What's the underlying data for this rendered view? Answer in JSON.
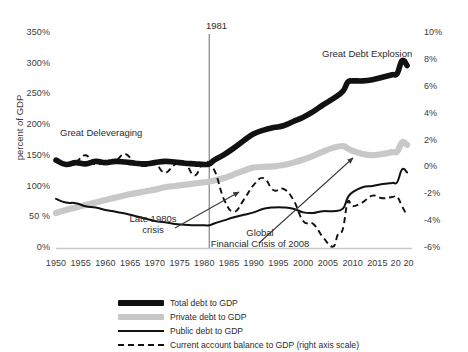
{
  "chart_data": {
    "type": "line",
    "title": "",
    "subtitle": "",
    "xlabel": "",
    "ylabel": "percent of GDP",
    "ylabel_right": "",
    "xlim": [
      1950,
      2022
    ],
    "ylim": [
      0,
      350
    ],
    "ylim_right": [
      -6,
      10
    ],
    "grid": false,
    "legend_position": "bottom",
    "x_ticks": [
      "1950",
      "1955",
      "1960",
      "1965",
      "1970",
      "1975",
      "1980",
      "1985",
      "1990",
      "1995",
      "2000",
      "2005",
      "2010",
      "2015",
      "2020"
    ],
    "y_ticks_left": [
      "0%",
      "50%",
      "100%",
      "150%",
      "200%",
      "250%",
      "300%",
      "350%"
    ],
    "y_ticks_right": [
      "-6%",
      "-4%",
      "-2%",
      "0%",
      "2%",
      "4%",
      "6%",
      "8%",
      "10%"
    ],
    "series": [
      {
        "name": "Total debt to GDP",
        "axis": "left",
        "style": "thick-solid",
        "color": "#111111",
        "x": [
          1950,
          1952,
          1954,
          1956,
          1958,
          1960,
          1962,
          1964,
          1966,
          1968,
          1970,
          1972,
          1974,
          1976,
          1978,
          1980,
          1981,
          1982,
          1984,
          1986,
          1988,
          1990,
          1992,
          1994,
          1996,
          1998,
          2000,
          2002,
          2004,
          2006,
          2008,
          2009,
          2010,
          2012,
          2014,
          2016,
          2018,
          2019,
          2020,
          2021
        ],
        "values": [
          143,
          136,
          139,
          137,
          141,
          139,
          141,
          140,
          138,
          137,
          139,
          141,
          140,
          138,
          137,
          136,
          137,
          143,
          152,
          163,
          175,
          186,
          192,
          196,
          199,
          206,
          213,
          222,
          233,
          243,
          255,
          270,
          272,
          272,
          274,
          278,
          282,
          284,
          305,
          297
        ]
      },
      {
        "name": "Private debt to GDP",
        "axis": "left",
        "style": "thick-grey",
        "color": "#c8c8c8",
        "x": [
          1950,
          1952,
          1954,
          1956,
          1958,
          1960,
          1962,
          1964,
          1966,
          1968,
          1970,
          1972,
          1974,
          1976,
          1978,
          1980,
          1981,
          1982,
          1984,
          1986,
          1988,
          1990,
          1992,
          1994,
          1996,
          1998,
          2000,
          2002,
          2004,
          2006,
          2008,
          2009,
          2010,
          2012,
          2014,
          2016,
          2018,
          2019,
          2020,
          2021
        ],
        "values": [
          57,
          62,
          66,
          70,
          74,
          78,
          82,
          86,
          89,
          92,
          95,
          99,
          101,
          103,
          105,
          107,
          108,
          110,
          114,
          120,
          126,
          131,
          132,
          133,
          135,
          139,
          144,
          150,
          157,
          163,
          166,
          162,
          158,
          153,
          151,
          153,
          156,
          157,
          172,
          168
        ]
      },
      {
        "name": "Public debt to GDP",
        "axis": "left",
        "style": "thin-solid",
        "color": "#111111",
        "x": [
          1950,
          1952,
          1954,
          1956,
          1958,
          1960,
          1962,
          1964,
          1966,
          1968,
          1970,
          1972,
          1974,
          1976,
          1978,
          1980,
          1981,
          1982,
          1984,
          1986,
          1988,
          1990,
          1992,
          1994,
          1996,
          1998,
          2000,
          2002,
          2004,
          2006,
          2008,
          2009,
          2010,
          2012,
          2014,
          2016,
          2018,
          2019,
          2020,
          2021
        ],
        "values": [
          80,
          74,
          73,
          68,
          66,
          62,
          59,
          56,
          52,
          48,
          44,
          42,
          39,
          38,
          37,
          37,
          37,
          40,
          45,
          50,
          54,
          58,
          64,
          66,
          66,
          64,
          58,
          57,
          60,
          60,
          64,
          82,
          91,
          99,
          101,
          104,
          106,
          107,
          128,
          123
        ]
      },
      {
        "name": "Current account balance to GDP (right axis scale)",
        "axis": "right",
        "style": "dashed",
        "color": "#111111",
        "x": [
          1950,
          1952,
          1954,
          1956,
          1958,
          1960,
          1962,
          1964,
          1966,
          1968,
          1970,
          1972,
          1974,
          1976,
          1978,
          1980,
          1982,
          1984,
          1986,
          1988,
          1990,
          1992,
          1994,
          1996,
          1998,
          2000,
          2002,
          2004,
          2006,
          2007,
          2008,
          2009,
          2010,
          2012,
          2014,
          2016,
          2018,
          2019,
          2020,
          2021
        ],
        "values": [
          0.5,
          0.3,
          0.4,
          0.9,
          0.2,
          0.5,
          0.5,
          1.0,
          0.3,
          0.1,
          0.3,
          -0.4,
          0.2,
          0.4,
          -0.6,
          0.4,
          -0.2,
          -2.4,
          -3.3,
          -2.4,
          -1.3,
          -0.8,
          -1.7,
          -1.6,
          -2.4,
          -4.0,
          -4.2,
          -5.2,
          -5.9,
          -5.0,
          -4.6,
          -2.6,
          -2.9,
          -2.6,
          -2.1,
          -2.3,
          -2.2,
          -2.2,
          -2.9,
          -3.6
        ]
      }
    ],
    "annotations": [
      {
        "id": "great-deleveraging",
        "text": "Great Deleveraging"
      },
      {
        "id": "great-debt-explosion",
        "text": "Great Debt Explosion"
      },
      {
        "id": "late-1980s-crisis",
        "text_line1": "Late 1980s",
        "text_line2": "crisis"
      },
      {
        "id": "global-financial-crisis",
        "text_line1": "Global",
        "text_line2": "Financial Crisis of 2008"
      },
      {
        "id": "vline-1981",
        "text": "1981"
      }
    ]
  },
  "axes": {
    "y_left_label": "percent of GDP",
    "y_left_ticks": [
      {
        "label": "350%",
        "value": 350
      },
      {
        "label": "300%",
        "value": 300
      },
      {
        "label": "250%",
        "value": 250
      },
      {
        "label": "200%",
        "value": 200
      },
      {
        "label": "150%",
        "value": 150
      },
      {
        "label": "100%",
        "value": 100
      },
      {
        "label": "50 %",
        "value": 50
      },
      {
        "label": "0%",
        "value": 0
      }
    ],
    "y_right_ticks": [
      {
        "label": "10%",
        "value": 10
      },
      {
        "label": "8%",
        "value": 8
      },
      {
        "label": "6%",
        "value": 6
      },
      {
        "label": "4%",
        "value": 4
      },
      {
        "label": "2%",
        "value": 2
      },
      {
        "label": "0%",
        "value": 0
      },
      {
        "label": "-2%",
        "value": -2
      },
      {
        "label": "-4%",
        "value": -4
      },
      {
        "label": "-6%",
        "value": -6
      }
    ],
    "x_ticks": [
      {
        "label": "1950",
        "value": 1950
      },
      {
        "label": "1955",
        "value": 1955
      },
      {
        "label": "1960",
        "value": 1960
      },
      {
        "label": "1965",
        "value": 1965
      },
      {
        "label": "1970",
        "value": 1970
      },
      {
        "label": "1975",
        "value": 1975
      },
      {
        "label": "1980",
        "value": 1980
      },
      {
        "label": "1985",
        "value": 1985
      },
      {
        "label": "1990",
        "value": 1990
      },
      {
        "label": "1995",
        "value": 1995
      },
      {
        "label": "2000",
        "value": 2000
      },
      {
        "label": "2005",
        "value": 2005
      },
      {
        "label": "2010",
        "value": 2010
      },
      {
        "label": "2015",
        "value": 2015
      },
      {
        "label": "20 20",
        "value": 2020
      }
    ]
  },
  "annotations": {
    "vline_year": "1981",
    "great_deleveraging": "Great Deleveraging",
    "great_debt_explosion": "Great Debt Explosion",
    "late_crisis_l1": "Late 1980s",
    "late_crisis_l2": "crisis",
    "gfc_l1": "Global",
    "gfc_l2": "Financial Crisis of 2008"
  },
  "legend": {
    "items": [
      {
        "label": "Total debt to GDP",
        "key": "thick-black"
      },
      {
        "label": "Private debt to GDP",
        "key": "thick-grey"
      },
      {
        "label": "Public debt to GDP",
        "key": "thin-black"
      },
      {
        "label": "Current account balance to GDP (right axis scale)",
        "key": "dashed-black"
      }
    ]
  },
  "colors": {
    "total": "#111111",
    "private": "#c8c8c8",
    "public": "#111111",
    "current_account": "#111111",
    "axis": "#bdbdbd",
    "text": "#2b2b2b"
  }
}
